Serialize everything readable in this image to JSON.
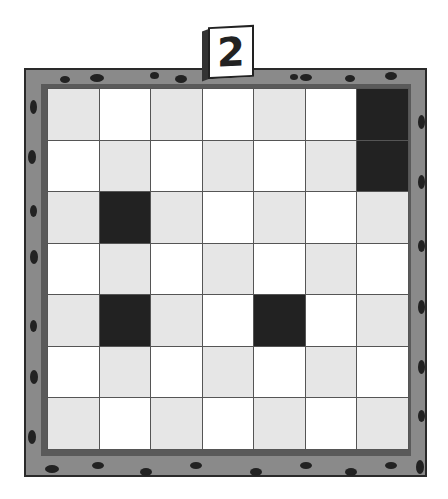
{
  "level_card": {
    "number": "2"
  },
  "board": {
    "rows": 7,
    "cols": 7,
    "colors": {
      "light": "#e6e6e6",
      "white": "#ffffff",
      "dark": "#222222",
      "frame": "#8a8a8a"
    },
    "cells": [
      [
        "light",
        "white",
        "light",
        "white",
        "light",
        "white",
        "dark"
      ],
      [
        "white",
        "light",
        "white",
        "light",
        "white",
        "light",
        "dark"
      ],
      [
        "light",
        "dark",
        "light",
        "white",
        "light",
        "white",
        "light"
      ],
      [
        "white",
        "light",
        "white",
        "light",
        "white",
        "light",
        "white"
      ],
      [
        "light",
        "dark",
        "light",
        "white",
        "dark",
        "white",
        "light"
      ],
      [
        "white",
        "light",
        "white",
        "light",
        "white",
        "light",
        "white"
      ],
      [
        "light",
        "white",
        "light",
        "white",
        "light",
        "white",
        "light"
      ]
    ]
  }
}
